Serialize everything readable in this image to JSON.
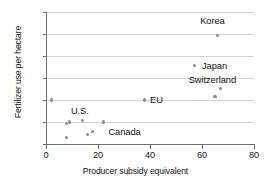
{
  "chart_data": {
    "type": "scatter",
    "title": "",
    "xlabel": "Producer subsidy equivalent",
    "ylabel": "Fertilizer use per hectare",
    "xlim": [
      0,
      80
    ],
    "ylim": [
      0,
      600
    ],
    "xticks": [
      0,
      20,
      40,
      60,
      80
    ],
    "yticks": [
      0,
      100,
      200,
      300,
      400,
      500,
      600
    ],
    "xtick_labels": [
      "0",
      "20",
      "40",
      "60",
      "80"
    ],
    "ytick_labels": [
      "0",
      "100",
      "200",
      "300",
      "400",
      "500",
      "600"
    ],
    "grid": "horizontal",
    "legend": "none",
    "marker_color": "#8d8d8d",
    "grid_color": "#d2d2d2",
    "axis_color": "#6e6e6e",
    "points": [
      {
        "x": 2,
        "y": 200,
        "label": ""
      },
      {
        "x": 8,
        "y": 30,
        "label": ""
      },
      {
        "x": 8,
        "y": 95,
        "label": ""
      },
      {
        "x": 9,
        "y": 100,
        "label": ""
      },
      {
        "x": 14,
        "y": 105,
        "label": ""
      },
      {
        "x": 16,
        "y": 45,
        "label": ""
      },
      {
        "x": 18,
        "y": 58,
        "label": ""
      },
      {
        "x": 22,
        "y": 100,
        "label": ""
      },
      {
        "x": 38,
        "y": 200,
        "label": "EU"
      },
      {
        "x": 57,
        "y": 358,
        "label": "Japan"
      },
      {
        "x": 65,
        "y": 215,
        "label": ""
      },
      {
        "x": 66,
        "y": 495,
        "label": "Korea"
      },
      {
        "x": 67,
        "y": 253,
        "label": "Switzerland"
      }
    ],
    "annotations": [
      {
        "text": "Korea",
        "x": 64,
        "y": 560,
        "align": "center"
      },
      {
        "text": "Japan",
        "x": 60,
        "y": 355,
        "align": "left"
      },
      {
        "text": "Switzerland",
        "x": 64,
        "y": 290,
        "align": "center"
      },
      {
        "text": "EU",
        "x": 40,
        "y": 200,
        "align": "left"
      },
      {
        "text": "U.S.",
        "x": 13,
        "y": 148,
        "align": "center"
      },
      {
        "text": "Canada",
        "x": 24,
        "y": 55,
        "align": "left"
      }
    ]
  }
}
